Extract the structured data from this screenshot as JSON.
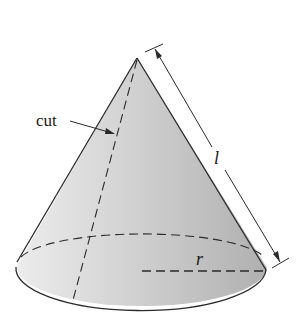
{
  "diagram": {
    "type": "cone",
    "labels": {
      "cut": "cut",
      "slant_height": "l",
      "radius": "r"
    },
    "colors": {
      "fill_light": "#e6e6e6",
      "fill_dark": "#b4b4b4",
      "stroke": "#2a2a2a"
    }
  }
}
